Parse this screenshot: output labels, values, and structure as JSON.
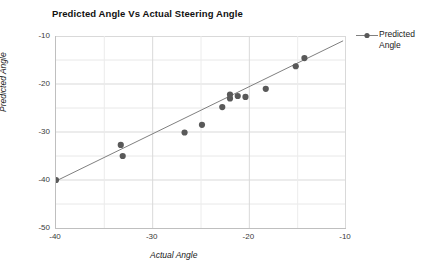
{
  "chart_data": {
    "type": "scatter",
    "title": "Predicted Angle Vs Actual Steering Angle",
    "xlabel": "Actual Angle",
    "ylabel": "Predicted Angle",
    "xlim": [
      -40,
      -10
    ],
    "ylim": [
      -50,
      -10
    ],
    "xticks": [
      "-40",
      "-30",
      "-20",
      "-10"
    ],
    "xtick_values": [
      -40,
      -30,
      -20,
      -10
    ],
    "yticks": [
      "-10",
      "-20",
      "-30",
      "-40",
      "-50"
    ],
    "ytick_values": [
      -10,
      -20,
      -30,
      -40,
      -50
    ],
    "grid": true,
    "grid_minor": true,
    "legend_position": "right",
    "series": [
      {
        "name": "Predicted Angle",
        "marker": "circle",
        "marker_color": "#595959",
        "line_color": "#808080",
        "points": [
          {
            "x": -40.0,
            "y": -40.0
          },
          {
            "x": -33.3,
            "y": -32.7
          },
          {
            "x": -33.1,
            "y": -35.0
          },
          {
            "x": -26.7,
            "y": -30.1
          },
          {
            "x": -24.9,
            "y": -28.5
          },
          {
            "x": -22.8,
            "y": -24.8
          },
          {
            "x": -22.0,
            "y": -23.0
          },
          {
            "x": -22.0,
            "y": -22.2
          },
          {
            "x": -21.2,
            "y": -22.5
          },
          {
            "x": -20.4,
            "y": -22.7
          },
          {
            "x": -18.3,
            "y": -21.0
          },
          {
            "x": -15.2,
            "y": -16.3
          },
          {
            "x": -14.3,
            "y": -14.6
          }
        ],
        "trendline": {
          "x0": -40.6,
          "y0": -40.8,
          "x1": -10.3,
          "y1": -11.0
        }
      }
    ]
  },
  "legend": {
    "entries": [
      {
        "label": "Predicted Angle",
        "symbol": "line-with-marker"
      }
    ]
  }
}
